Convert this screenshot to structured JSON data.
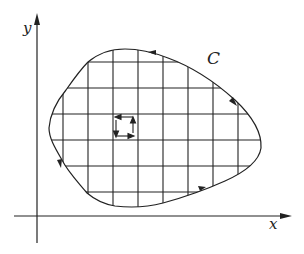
{
  "diagram": {
    "axes": {
      "x_label": "x",
      "y_label": "y"
    },
    "curve": {
      "label": "C",
      "orientation": "counterclockwise",
      "arrow_count": 4
    },
    "grid": {
      "vertical_lines": 8,
      "horizontal_lines": 6
    },
    "small_square": {
      "circulation": "counterclockwise",
      "arrows": [
        "left",
        "down",
        "right",
        "up"
      ]
    },
    "colors": {
      "stroke": "#222222",
      "background": "#ffffff"
    }
  }
}
